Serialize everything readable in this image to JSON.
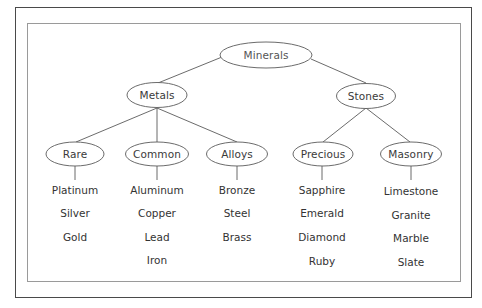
{
  "diagram": {
    "type": "tree",
    "colors": {
      "line": "#5a5a5a",
      "node_border": "#5a5a5a",
      "text": "#333333",
      "outer_frame": "#4a4a4a",
      "inner_frame": "#9a9a9a"
    },
    "root": {
      "label": "Minerals"
    },
    "level1": [
      {
        "label": "Metals"
      },
      {
        "label": "Stones"
      }
    ],
    "level2": [
      {
        "label": "Rare",
        "parent": "Metals",
        "items": [
          "Platinum",
          "Silver",
          "Gold"
        ]
      },
      {
        "label": "Common",
        "parent": "Metals",
        "items": [
          "Aluminum",
          "Copper",
          "Lead",
          "Iron"
        ]
      },
      {
        "label": "Alloys",
        "parent": "Metals",
        "items": [
          "Bronze",
          "Steel",
          "Brass"
        ]
      },
      {
        "label": "Precious",
        "parent": "Stones",
        "items": [
          "Sapphire",
          "Emerald",
          "Diamond",
          "Ruby"
        ]
      },
      {
        "label": "Masonry",
        "parent": "Stones",
        "items": [
          "Limestone",
          "Granite",
          "Marble",
          "Slate"
        ]
      }
    ]
  }
}
